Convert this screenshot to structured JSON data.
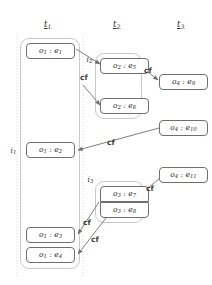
{
  "diagram": {
    "title_row": [
      {
        "name": "t1",
        "label": "t",
        "sub": "1",
        "x": 44,
        "y": 19
      },
      {
        "name": "t2",
        "label": "t",
        "sub": "2",
        "x": 113,
        "y": 19
      },
      {
        "name": "t3",
        "label": "t",
        "sub": "3",
        "x": 177,
        "y": 19
      }
    ],
    "groups": [
      {
        "name": "i1",
        "label": "i",
        "sub": "1",
        "x": 20,
        "y": 38,
        "w": 60,
        "h": 231,
        "label_x": 10,
        "label_y": 146
      },
      {
        "name": "i2",
        "label": "i",
        "sub": "2",
        "x": 95,
        "y": 53,
        "w": 47,
        "h": 66,
        "label_x": 86,
        "label_y": 55
      },
      {
        "name": "i3",
        "label": "i",
        "sub": "3",
        "x": 95,
        "y": 181,
        "w": 49,
        "h": 42,
        "label_x": 87,
        "label_y": 175
      }
    ],
    "events": [
      {
        "name": "o1-e1",
        "obj": "o",
        "obj_sub": "1",
        "ev": "e",
        "ev_sub": "1",
        "x": 26,
        "y": 43,
        "w": 49,
        "h": 16,
        "shape": "round"
      },
      {
        "name": "o1-e2",
        "obj": "o",
        "obj_sub": "1",
        "ev": "e",
        "ev_sub": "2",
        "x": 26,
        "y": 142,
        "w": 49,
        "h": 16,
        "shape": "round"
      },
      {
        "name": "o1-e3",
        "obj": "o",
        "obj_sub": "1",
        "ev": "e",
        "ev_sub": "3",
        "x": 26,
        "y": 227,
        "w": 49,
        "h": 16,
        "shape": "round"
      },
      {
        "name": "o1-e4",
        "obj": "o",
        "obj_sub": "1",
        "ev": "e",
        "ev_sub": "4",
        "x": 26,
        "y": 247,
        "w": 49,
        "h": 16,
        "shape": "round"
      },
      {
        "name": "o2-e5",
        "obj": "o",
        "obj_sub": "2",
        "ev": "e",
        "ev_sub": "5",
        "x": 100,
        "y": 58,
        "w": 49,
        "h": 16,
        "shape": "round"
      },
      {
        "name": "o2-e6",
        "obj": "o",
        "obj_sub": "2",
        "ev": "e",
        "ev_sub": "6",
        "x": 100,
        "y": 98,
        "w": 49,
        "h": 16,
        "shape": "round"
      },
      {
        "name": "o3-e7",
        "obj": "o",
        "obj_sub": "3",
        "ev": "e",
        "ev_sub": "7",
        "x": 100,
        "y": 186,
        "w": 49,
        "h": 16,
        "shape": "sq-bottom"
      },
      {
        "name": "o3-e8",
        "obj": "o",
        "obj_sub": "3",
        "ev": "e",
        "ev_sub": "8",
        "x": 100,
        "y": 202,
        "w": 49,
        "h": 16,
        "shape": "sq-top"
      },
      {
        "name": "o4-e9",
        "obj": "o",
        "obj_sub": "4",
        "ev": "e",
        "ev_sub": "9",
        "x": 159,
        "y": 74,
        "w": 49,
        "h": 16,
        "shape": "round"
      },
      {
        "name": "o4-e10",
        "obj": "o",
        "obj_sub": "4",
        "ev": "e",
        "ev_sub": "10",
        "x": 159,
        "y": 120,
        "w": 49,
        "h": 16,
        "shape": "round"
      },
      {
        "name": "o4-e11",
        "obj": "o",
        "obj_sub": "4",
        "ev": "e",
        "ev_sub": "11",
        "x": 159,
        "y": 167,
        "w": 49,
        "h": 16,
        "shape": "round"
      }
    ],
    "cf_labels": [
      {
        "name": "cf-e1-e5",
        "text": "cf",
        "x": 80,
        "y": 73
      },
      {
        "name": "cf-e5-e9",
        "text": "cf",
        "x": 144,
        "y": 66
      },
      {
        "name": "cf-e10-e2",
        "text": "cf",
        "x": 107,
        "y": 138
      },
      {
        "name": "cf-e11-e7",
        "text": "cf",
        "x": 146,
        "y": 184
      },
      {
        "name": "cf-e7-e3",
        "text": "cf",
        "x": 83,
        "y": 218
      },
      {
        "name": "cf-e8-e4",
        "text": "cf",
        "x": 91,
        "y": 235
      }
    ],
    "edges": [
      {
        "name": "edge-e1-to-e5",
        "from": "o1-e1",
        "to": "o2-e5",
        "d": "M 76,49 L 100,64",
        "arrow": true
      },
      {
        "name": "edge-cf-to-e6",
        "from": "cf",
        "to": "o2-e6",
        "d": "M 83,85 L 100,105",
        "arrow": true
      },
      {
        "name": "edge-e5-to-e9",
        "from": "o2-e5",
        "to": "o4-e9",
        "d": "M 143,68 L 158,80",
        "arrow": true
      },
      {
        "name": "edge-e10-to-e2",
        "from": "o4-e10",
        "to": "o1-e2",
        "d": "M 159,128 L 78,150",
        "arrow": true
      },
      {
        "name": "edge-e11-to-e7",
        "from": "o4-e11",
        "to": "o3-e7",
        "d": "M 160,178 L 142,193",
        "arrow": true
      },
      {
        "name": "edge-e7-to-e3",
        "from": "o3-e7",
        "to": "o1-e3",
        "d": "M 99,202 L 78,234",
        "arrow": true
      },
      {
        "name": "edge-e8-to-e4",
        "from": "o3-e8",
        "to": "o1-e4",
        "d": "M 106,218 L 78,254",
        "arrow": true
      }
    ],
    "guides": [
      {
        "name": "guide-line-t1-t2",
        "x": 83,
        "y1": 35,
        "y2": 278
      },
      {
        "name": "guide-line-left",
        "x": 17,
        "y1": 35,
        "y2": 278
      }
    ],
    "colors": {
      "stroke": "#6f6f6f",
      "group_stroke": "#c9c9c9",
      "guide": "#cfcfcf",
      "text": "#2b2b2b",
      "background": "#ffffff"
    }
  }
}
